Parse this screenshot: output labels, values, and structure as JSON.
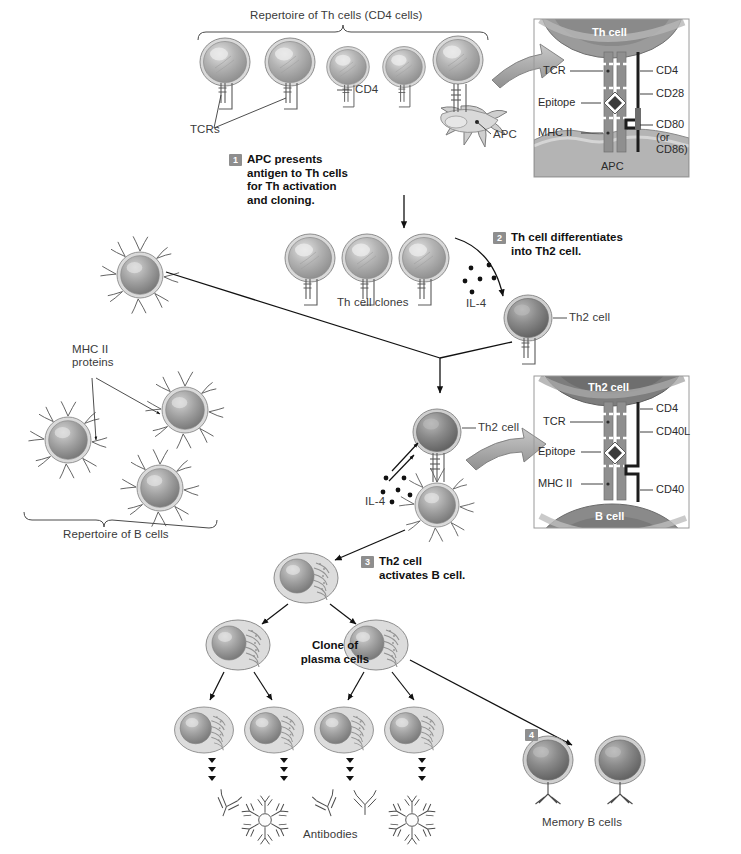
{
  "figure": {
    "background": "#ffffff",
    "badge_color": "#8e8e8e",
    "cell_fill": "#9a9a9a",
    "line_color": "#1a1a1a"
  },
  "top": {
    "repertoire_label": "Repertoire of Th cells (CD4 cells)",
    "tcr_label": "TCRs",
    "cd4_label": "CD4",
    "apc_label": "APC"
  },
  "steps": [
    {
      "num": "1",
      "text": "APC presents\nantigen to Th cells\nfor Th activation\nand cloning."
    },
    {
      "num": "2",
      "text": "Th cell differentiates\ninto Th2 cell."
    },
    {
      "num": "3",
      "text": "Th2 cell\nactivates B cell."
    },
    {
      "num": "4",
      "text": ""
    }
  ],
  "middle": {
    "th_clones_label": "Th cell clones",
    "il4_label_top": "IL-4",
    "il4_label_mid": "IL-4",
    "th2_label_top": "Th2 cell",
    "th2_label_mid": "Th2 cell",
    "mhc2_label": "MHC II\nproteins",
    "b_repertoire_label": "Repertoire of B cells"
  },
  "bottom": {
    "clone_label": "Clone of\nplasma cells",
    "antibodies_label": "Antibodies",
    "memory_label": "Memory B cells"
  },
  "panel_top": {
    "cell_top_label": "Th cell",
    "cell_bottom_label": "APC",
    "left_labels": [
      "TCR",
      "Epitope",
      "MHC II"
    ],
    "right_labels": [
      "CD4",
      "CD28",
      "CD80\n(or\nCD86)"
    ]
  },
  "panel_bottom": {
    "cell_top_label": "Th2 cell",
    "cell_bottom_label": "B cell",
    "left_labels": [
      "TCR",
      "Epitope",
      "MHC II"
    ],
    "right_labels": [
      "CD4",
      "CD40L",
      "CD40"
    ]
  }
}
